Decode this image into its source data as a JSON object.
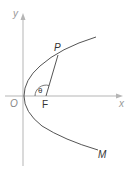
{
  "diagram": {
    "labels": {
      "y_axis": "y",
      "x_axis": "x",
      "origin": "O",
      "focus": "F",
      "point_p": "P",
      "point_m": "M",
      "angle": "θ"
    },
    "colors": {
      "axis": "#b0b0b0",
      "curve": "#555555",
      "text": "#333333",
      "axis_text": "#999999"
    }
  }
}
